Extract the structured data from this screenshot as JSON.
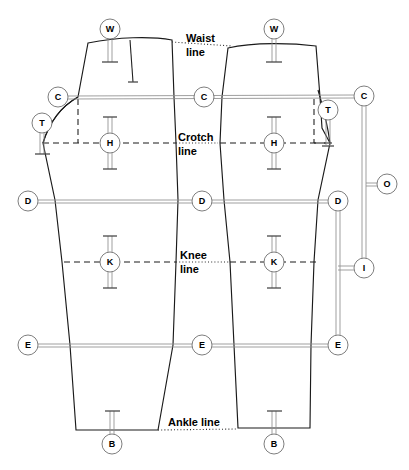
{
  "diagram": {
    "canvas": {
      "width": 409,
      "height": 470,
      "background": "#ffffff"
    },
    "stroke_colors": {
      "outline": "#1a1a1a",
      "rail": "#8e8e8e",
      "marker_ring": "#6f6f6f",
      "text": "#000000"
    },
    "reference_lines": [
      {
        "id": "waist",
        "label_line1": "Waist",
        "label_line2": "line",
        "label_single": "Waist line",
        "y": 44,
        "style": "dotted",
        "x_start": 176,
        "x_end": 246
      },
      {
        "id": "crotch",
        "label_line1": "Crotch",
        "label_line2": "line",
        "label_single": "Crotch line",
        "y": 143,
        "style": "dashed",
        "x_start": 43,
        "x_end": 344
      },
      {
        "id": "knee",
        "label_line1": "Knee",
        "label_line2": "line",
        "label_single": "Knee line",
        "y": 262,
        "style": "dashed",
        "x_start": 64,
        "x_end": 320
      },
      {
        "id": "ankle",
        "label_line1": "Ankle line",
        "label_line2": "",
        "label_single": "Ankle line",
        "y": 430,
        "style": "dotted",
        "x_start": 158,
        "x_end": 238
      }
    ],
    "markers": [
      {
        "id": "w-left",
        "letter": "W",
        "cx": 110,
        "cy": 29,
        "r": 10,
        "orientation": "down",
        "stem_length": 33
      },
      {
        "id": "w-right",
        "letter": "W",
        "cx": 274,
        "cy": 29,
        "r": 10,
        "orientation": "down",
        "stem_length": 33
      },
      {
        "id": "c-left",
        "letter": "C",
        "cx": 58,
        "cy": 97,
        "r": 10,
        "orientation": "right",
        "stem_length": 0
      },
      {
        "id": "c-center",
        "letter": "C",
        "cx": 204,
        "cy": 97,
        "r": 10,
        "orientation": "none",
        "stem_length": 0
      },
      {
        "id": "c-right",
        "letter": "C",
        "cx": 364,
        "cy": 96,
        "r": 10,
        "orientation": "down",
        "stem_length": 0
      },
      {
        "id": "t-left",
        "letter": "T",
        "cx": 42,
        "cy": 123,
        "r": 10,
        "orientation": "down",
        "stem_length": 28
      },
      {
        "id": "t-right",
        "letter": "T",
        "cx": 328,
        "cy": 110,
        "r": 10,
        "orientation": "down",
        "stem_length": 35
      },
      {
        "id": "h-left",
        "letter": "H",
        "cx": 110,
        "cy": 143,
        "r": 10,
        "orientation": "both",
        "stem_length": 26
      },
      {
        "id": "h-right",
        "letter": "H",
        "cx": 274,
        "cy": 143,
        "r": 10,
        "orientation": "both",
        "stem_length": 26
      },
      {
        "id": "d-left",
        "letter": "D",
        "cx": 28,
        "cy": 201,
        "r": 10,
        "orientation": "right",
        "stem_length": 0
      },
      {
        "id": "d-center",
        "letter": "D",
        "cx": 202,
        "cy": 201,
        "r": 10,
        "orientation": "none",
        "stem_length": 0
      },
      {
        "id": "d-right",
        "letter": "D",
        "cx": 338,
        "cy": 201,
        "r": 10,
        "orientation": "down",
        "stem_length": 0
      },
      {
        "id": "o-right",
        "letter": "O",
        "cx": 387,
        "cy": 184,
        "r": 10,
        "orientation": "left",
        "stem_length": 0
      },
      {
        "id": "k-left",
        "letter": "K",
        "cx": 110,
        "cy": 262,
        "r": 10,
        "orientation": "both",
        "stem_length": 26
      },
      {
        "id": "k-right",
        "letter": "K",
        "cx": 274,
        "cy": 262,
        "r": 10,
        "orientation": "both",
        "stem_length": 26
      },
      {
        "id": "i-right",
        "letter": "I",
        "cx": 364,
        "cy": 268,
        "r": 10,
        "orientation": "left",
        "stem_length": 0
      },
      {
        "id": "e-left",
        "letter": "E",
        "cx": 28,
        "cy": 345,
        "r": 10,
        "orientation": "right",
        "stem_length": 0
      },
      {
        "id": "e-center",
        "letter": "E",
        "cx": 202,
        "cy": 345,
        "r": 10,
        "orientation": "none",
        "stem_length": 0
      },
      {
        "id": "e-right",
        "letter": "E",
        "cx": 338,
        "cy": 345,
        "r": 10,
        "orientation": "up",
        "stem_length": 0
      },
      {
        "id": "b-left",
        "letter": "B",
        "cx": 112,
        "cy": 444,
        "r": 10,
        "orientation": "up",
        "stem_length": 28
      },
      {
        "id": "b-right",
        "letter": "B",
        "cx": 274,
        "cy": 444,
        "r": 10,
        "orientation": "up",
        "stem_length": 28
      }
    ],
    "measurement_rails": [
      {
        "id": "rail-c",
        "from": "c-left",
        "to": "c-right",
        "y": 97,
        "x1": 68,
        "x2": 354
      },
      {
        "id": "rail-d",
        "from": "d-left",
        "to": "d-right",
        "y": 201,
        "x1": 38,
        "x2": 328
      },
      {
        "id": "rail-e",
        "from": "e-left",
        "to": "e-right",
        "y": 345,
        "x1": 38,
        "x2": 328
      },
      {
        "id": "rail-o",
        "from": "c-right-vertical",
        "to": "o-right",
        "y": 184,
        "x1": 364,
        "x2": 377
      },
      {
        "id": "rail-i",
        "from": "d-right-vertical",
        "to": "i-right",
        "y": 268,
        "x1": 338,
        "x2": 354
      },
      {
        "id": "rail-vert-c-i",
        "orientation": "vertical",
        "x": 364,
        "y1": 106,
        "y2": 268
      },
      {
        "id": "rail-vert-d-e",
        "orientation": "vertical",
        "x": 338,
        "y1": 211,
        "y2": 335
      }
    ]
  }
}
